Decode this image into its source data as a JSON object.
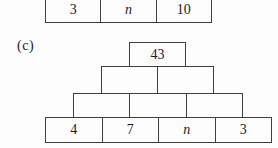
{
  "colors": {
    "background": "#fcfcfc",
    "line": "#3f3f3f",
    "text": "#1c1c1c"
  },
  "previous_pyramid_bottom_row": {
    "cells": [
      "3",
      "n",
      "10"
    ]
  },
  "part_label": "(c)",
  "pyramid_c": {
    "row1": [
      "43"
    ],
    "row2": [
      "",
      ""
    ],
    "row3": [
      "",
      "",
      ""
    ],
    "row4": [
      "4",
      "7",
      "n",
      "3"
    ]
  }
}
